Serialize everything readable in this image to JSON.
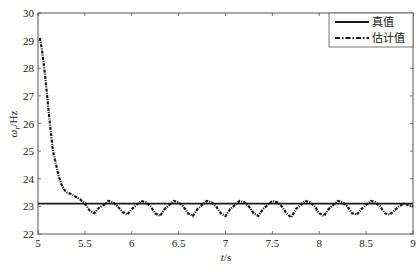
{
  "chart_data": {
    "type": "line",
    "title": "",
    "xlabel": "t/s",
    "ylabel": "ω_r/Hz",
    "xlim": [
      5,
      9
    ],
    "ylim": [
      22,
      30
    ],
    "xticks": [
      5,
      5.5,
      6,
      6.5,
      7,
      7.5,
      8,
      8.5,
      9
    ],
    "xtick_labels": [
      "5",
      "5.5",
      "6",
      "6.5",
      "7",
      "7.5",
      "8",
      "8.5",
      "9"
    ],
    "yticks": [
      22,
      23,
      24,
      25,
      26,
      27,
      28,
      29,
      30
    ],
    "ytick_labels": [
      "22",
      "23",
      "24",
      "25",
      "26",
      "27",
      "28",
      "29",
      "30"
    ],
    "grid": false,
    "legend_position": "upper right",
    "series": [
      {
        "name": "真值",
        "style": "solid",
        "color": "#1a1a1a",
        "x": [
          5,
          9
        ],
        "values": [
          23.1,
          23.1
        ]
      },
      {
        "name": "估计值",
        "style": "dash-dot",
        "color": "#1a1a1a",
        "x": [
          5.02,
          5.04,
          5.06,
          5.08,
          5.1,
          5.12,
          5.14,
          5.16,
          5.18,
          5.2,
          5.22,
          5.25,
          5.28,
          5.31,
          5.35,
          5.4,
          5.45,
          5.5,
          5.55,
          5.6,
          5.65,
          5.7,
          5.75,
          5.8,
          5.85,
          5.9,
          5.95,
          6.0,
          6.05,
          6.1,
          6.15,
          6.2,
          6.25,
          6.3,
          6.35,
          6.4,
          6.45,
          6.5,
          6.55,
          6.6,
          6.65,
          6.7,
          6.75,
          6.8,
          6.85,
          6.9,
          6.95,
          7.0,
          7.05,
          7.1,
          7.15,
          7.2,
          7.25,
          7.3,
          7.35,
          7.4,
          7.45,
          7.5,
          7.55,
          7.6,
          7.65,
          7.7,
          7.75,
          7.8,
          7.85,
          7.9,
          7.95,
          8.0,
          8.05,
          8.1,
          8.15,
          8.2,
          8.25,
          8.3,
          8.35,
          8.4,
          8.45,
          8.5,
          8.55,
          8.6,
          8.65,
          8.7,
          8.75,
          8.8,
          8.85,
          8.9,
          8.95,
          9.0
        ],
        "values": [
          29.1,
          28.7,
          28.2,
          27.6,
          26.9,
          26.2,
          25.6,
          25.0,
          24.7,
          24.4,
          24.1,
          23.8,
          23.6,
          23.5,
          23.45,
          23.35,
          23.25,
          23.1,
          22.85,
          22.75,
          22.95,
          23.05,
          23.2,
          23.15,
          23.0,
          22.8,
          22.7,
          22.9,
          23.05,
          23.2,
          23.15,
          23.0,
          22.75,
          22.65,
          22.9,
          23.05,
          23.2,
          23.15,
          23.0,
          22.75,
          22.65,
          22.9,
          23.05,
          23.2,
          23.15,
          23.0,
          22.75,
          22.65,
          22.9,
          23.05,
          23.2,
          23.15,
          23.0,
          22.75,
          22.65,
          22.9,
          23.05,
          23.2,
          23.15,
          23.0,
          22.75,
          22.6,
          22.9,
          23.05,
          23.2,
          23.15,
          23.0,
          22.75,
          22.65,
          22.9,
          23.05,
          23.2,
          23.15,
          23.0,
          22.75,
          22.7,
          22.9,
          23.05,
          23.2,
          23.15,
          23.0,
          22.75,
          22.7,
          22.85,
          23.0,
          23.1,
          23.05,
          23.0
        ]
      }
    ]
  },
  "legend": {
    "items": [
      {
        "label": "真值",
        "style": "solid"
      },
      {
        "label": "估计值",
        "style": "dash-dot"
      }
    ]
  }
}
